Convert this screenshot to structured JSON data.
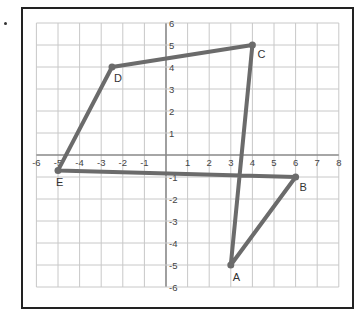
{
  "figure": {
    "type": "coordinate-plane",
    "x_range": [
      -6,
      8
    ],
    "y_range": [
      -6,
      6
    ],
    "x_ticks": [
      "-6",
      "-5",
      "-4",
      "-3",
      "-2",
      "-1",
      "1",
      "2",
      "3",
      "4",
      "5",
      "6",
      "7",
      "8"
    ],
    "y_ticks": [
      "6",
      "5",
      "4",
      "3",
      "2",
      "1",
      "-1",
      "-2",
      "-3",
      "-4",
      "-5",
      "-6"
    ],
    "polyline_color": "#6b6b6b",
    "grid_color": "#c8c8c8",
    "points": [
      {
        "label": "A",
        "x": 3,
        "y": -5
      },
      {
        "label": "B",
        "x": 6,
        "y": -1
      },
      {
        "label": "C",
        "x": 4,
        "y": 5
      },
      {
        "label": "D",
        "x": -2.5,
        "y": 4
      },
      {
        "label": "E",
        "x": -5,
        "y": -0.7
      }
    ],
    "path_order": [
      "A",
      "C",
      "D",
      "E",
      "B",
      "A"
    ]
  }
}
